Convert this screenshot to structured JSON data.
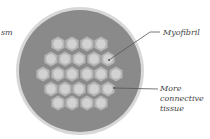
{
  "diagram": {
    "type": "muscle-fiber-cross-section",
    "labels": {
      "left_fragment": "sm",
      "myofibril": "Myofibril",
      "connective_tissue": "More connective tissue"
    },
    "colors": {
      "background": "#ffffff",
      "fiber_fill": "#8a8a8a",
      "fiber_border": "#d4d4d4",
      "hex_outer": "#b5b5b5",
      "hex_inner": "#d2d2d2",
      "pointer_line": "#555555",
      "label_text": "#444444"
    },
    "fiber": {
      "cx": 80,
      "cy": 71,
      "r": 62
    },
    "hex_rows": [
      {
        "y": 44,
        "xs": [
          58,
          72,
          87,
          101
        ]
      },
      {
        "y": 59,
        "xs": [
          51,
          65,
          79,
          94,
          108
        ]
      },
      {
        "y": 74,
        "xs": [
          43,
          58,
          72,
          87,
          101,
          116
        ]
      },
      {
        "y": 89,
        "xs": [
          51,
          65,
          79,
          94,
          108
        ]
      },
      {
        "y": 103,
        "xs": [
          58,
          72,
          87,
          101
        ]
      }
    ],
    "pointers": [
      {
        "name": "myofibril",
        "from": [
          160,
          32
        ],
        "bend": [
          150,
          32
        ],
        "to": [
          109,
          60
        ]
      },
      {
        "name": "connective-tissue",
        "from": [
          158,
          89
        ],
        "to": [
          114,
          88
        ]
      }
    ]
  }
}
